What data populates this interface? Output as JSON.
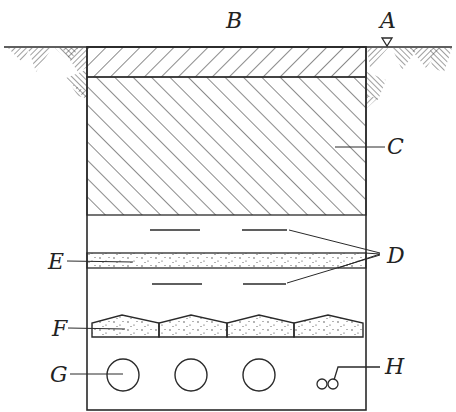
{
  "diagram": {
    "type": "cross-section",
    "labels": {
      "A": "A",
      "B": "B",
      "C": "C",
      "D": "D",
      "E": "E",
      "F": "F",
      "G": "G",
      "H": "H"
    },
    "parts": [
      {
        "id": "A",
        "meaning": "ground level marker (triangle)"
      },
      {
        "id": "B",
        "meaning": "trench width / ground surface label"
      },
      {
        "id": "C",
        "meaning": "backfill soil (hatched)"
      },
      {
        "id": "D",
        "meaning": "warning tapes"
      },
      {
        "id": "E",
        "meaning": "sand / fine fill layer"
      },
      {
        "id": "F",
        "meaning": "protective cover slabs"
      },
      {
        "id": "G",
        "meaning": "pipes / ducts"
      },
      {
        "id": "H",
        "meaning": "small cables"
      }
    ],
    "counts": {
      "cover_slabs": 4,
      "pipes": 3,
      "small_cables": 2,
      "warning_tapes_per_row": 2,
      "tape_rows": 2
    },
    "colors": {
      "line": "#2a2a2a",
      "background": "#ffffff"
    }
  }
}
